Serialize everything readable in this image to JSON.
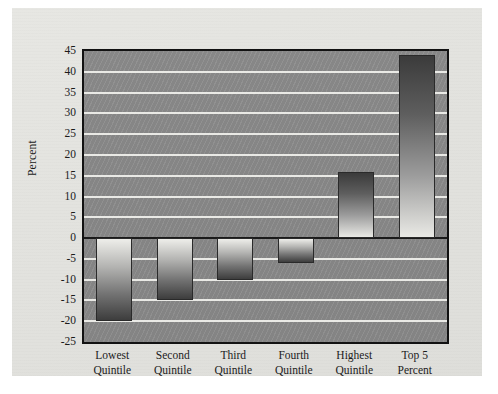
{
  "chart_data": {
    "type": "bar",
    "title": "",
    "subtitle": "",
    "xlabel": "",
    "ylabel": "Percent",
    "categories": [
      "Lowest Quintile",
      "Second Quintile",
      "Third Quintile",
      "Fourth Quintile",
      "Highest Quintile",
      "Top 5 Percent"
    ],
    "category_lines": [
      [
        "Lowest",
        "Quintile"
      ],
      [
        "Second",
        "Quintile"
      ],
      [
        "Third",
        "Quintile"
      ],
      [
        "Fourth",
        "Quintile"
      ],
      [
        "Highest",
        "Quintile"
      ],
      [
        "Top 5",
        "Percent"
      ]
    ],
    "values": [
      -20,
      -15,
      -10,
      -6,
      16,
      44
    ],
    "ylim": [
      -25,
      45
    ],
    "ytick_step": 5,
    "yticks": [
      45,
      40,
      35,
      30,
      25,
      20,
      15,
      10,
      5,
      0,
      -5,
      -10,
      -15,
      -20,
      -25
    ],
    "ytick_labels": [
      "45",
      "40",
      "35",
      "30",
      "25",
      "20",
      "15",
      "10",
      "5",
      "0",
      "-5",
      "-10",
      "-15",
      "-20",
      "-25"
    ],
    "grid": true,
    "grid_color": "#f2f2ee",
    "legend": false,
    "legend_position": "none",
    "plot_background": "#8a8a8a",
    "bar_border_color": "#2a2a2a",
    "zero_line_color": "#1a1a1a",
    "page_background": "#e4e4e0"
  }
}
